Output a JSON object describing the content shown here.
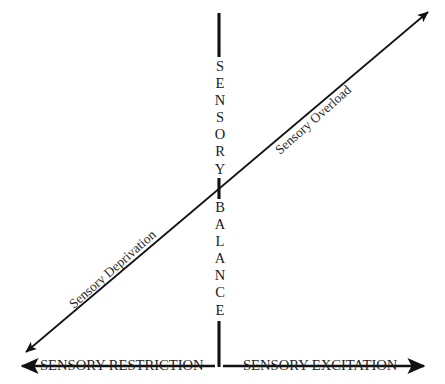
{
  "diagram": {
    "background_color": "#ffffff",
    "line_color": "#111111",
    "text_color": "#1a1a1a",
    "vertical_axis": {
      "upper_word": "SENSORY",
      "lower_word": "BALANCE",
      "upper_letters": [
        "S",
        "E",
        "N",
        "S",
        "O",
        "R",
        "Y"
      ],
      "lower_letters": [
        "B",
        "A",
        "L",
        "A",
        "N",
        "C",
        "E"
      ]
    },
    "horizontal_axis": {
      "left_label": "SENSORY RESTRICTION",
      "right_label": "SENSORY EXCITATION",
      "left_arrow": "arrow-left",
      "right_arrow": "arrow-right"
    },
    "diagonal_axis": {
      "lower_label": "Sensory Deprivation",
      "upper_label": "Sensory Overload",
      "lower_arrow": "arrow-down-left",
      "upper_arrow": "arrow-up-right"
    }
  }
}
